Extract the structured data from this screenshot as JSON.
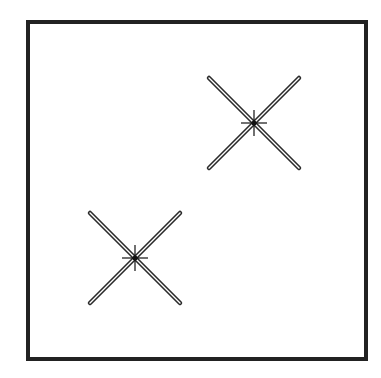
{
  "diagram": {
    "frame": {
      "x": 28,
      "y": 22,
      "width": 338,
      "height": 337,
      "stroke": "#222222",
      "stroke_width": 4
    },
    "markers": [
      {
        "name": "upper-right-cross",
        "cx": 254,
        "cy": 123,
        "half": 45
      },
      {
        "name": "lower-left-cross",
        "cx": 135,
        "cy": 258,
        "half": 45
      }
    ],
    "colors": {
      "line": "#2a2a2a",
      "fill": "#ffffff",
      "center": "#111111"
    }
  }
}
